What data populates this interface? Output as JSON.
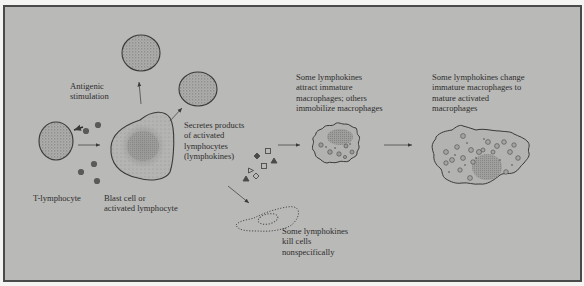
{
  "diagram": {
    "type": "biological-process",
    "topic": "T-lymphocyte activation and lymphokine effects",
    "colors": {
      "background_outer": "#f4f4f2",
      "panel_fill": "#b9b9b7",
      "panel_border": "#4a4a4a",
      "cell_outline": "#3a3a3a",
      "cell_stipple": "#8f8f8d",
      "text": "#2e2e2e"
    },
    "labels": {
      "antigenic": "Antigenic\nstimulation",
      "t_lymphocyte": "T-lymphocyte",
      "blast_cell": "Blast cell or\nactivated lymphocyte",
      "secretes": "Secretes products\nof activated\nlymphocytes\n(lymphokines)",
      "attract": "Some lymphokines\nattract immature\nmacrophages; others\nimmobilize macrophages",
      "change": "Some lymphokines change\nimmature macrophages to\nmature activated\nmacrophages",
      "kill": "Some lymphokines\nkill cells\nnonspecifically"
    },
    "nodes": [
      {
        "id": "t-lymphocyte",
        "label_ref": "t_lymphocyte"
      },
      {
        "id": "antigen-particles",
        "count": 5
      },
      {
        "id": "blast-cell",
        "label_ref": "blast_cell"
      },
      {
        "id": "daughter-lymphocyte-top"
      },
      {
        "id": "daughter-lymphocyte-right"
      },
      {
        "id": "lymphokine-symbols",
        "shapes": [
          "open-square",
          "filled-diamond",
          "filled-triangle",
          "open-square",
          "open-triangle",
          "filled-triangle",
          "open-diamond"
        ]
      },
      {
        "id": "immature-macrophage",
        "label_ref": "attract"
      },
      {
        "id": "mature-activated-macrophage",
        "label_ref": "change"
      },
      {
        "id": "killed-cell",
        "style": "dotted-outline",
        "label_ref": "kill"
      }
    ],
    "edges": [
      {
        "from": "t-lymphocyte",
        "to": "blast-cell",
        "note": "antigenic stimulation"
      },
      {
        "from": "antigen-particles",
        "to": "t-lymphocyte"
      },
      {
        "from": "blast-cell",
        "to": "daughter-lymphocyte-top"
      },
      {
        "from": "blast-cell",
        "to": "daughter-lymphocyte-right"
      },
      {
        "from": "lymphokine-symbols",
        "to": "immature-macrophage"
      },
      {
        "from": "immature-macrophage",
        "to": "mature-activated-macrophage"
      },
      {
        "from": "lymphokine-symbols",
        "to": "killed-cell"
      }
    ]
  }
}
